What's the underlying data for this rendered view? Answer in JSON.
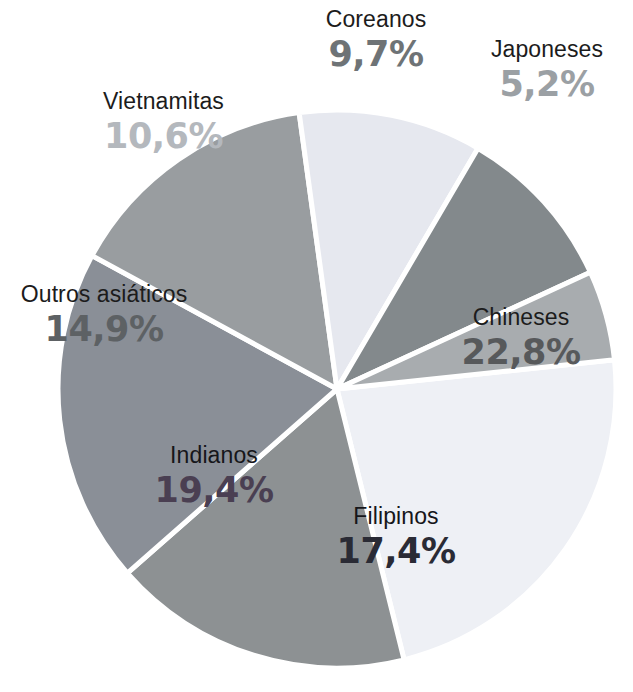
{
  "chart_data": {
    "type": "pie",
    "title": "",
    "subtitle": "",
    "xlabel": "",
    "ylabel": "",
    "legend_position": "none",
    "grid": false,
    "units": "%",
    "decimal_separator": ",",
    "total": 100.0,
    "categories": [
      "Chineses",
      "Filipinos",
      "Indianos",
      "Outros asiáticos",
      "Vietnamitas",
      "Coreanos",
      "Japoneses"
    ],
    "values": [
      22.8,
      17.4,
      19.4,
      14.9,
      10.6,
      9.7,
      5.2
    ],
    "slices": [
      {
        "label": "Chineses",
        "value": 22.8,
        "value_text": "22,8%",
        "color": "#eef0f5",
        "label_color": "#57595b",
        "name_color": "#1c1c1c"
      },
      {
        "label": "Filipinos",
        "value": 17.4,
        "value_text": "17,4%",
        "color": "#8d9193",
        "label_color": "#2a2b35",
        "name_color": "#16161a"
      },
      {
        "label": "Indianos",
        "value": 19.4,
        "value_text": "19,4%",
        "color": "#8a8f97",
        "label_color": "#4a3f52",
        "name_color": "#16161a"
      },
      {
        "label": "Outros asiáticos",
        "value": 14.9,
        "value_text": "14,9%",
        "color": "#999da0",
        "label_color": "#5d6164",
        "name_color": "#1c1c1c"
      },
      {
        "label": "Vietnamitas",
        "value": 10.6,
        "value_text": "10,6%",
        "color": "#e6e8ef",
        "label_color": "#b4b8bd",
        "name_color": "#1c1c1c"
      },
      {
        "label": "Coreanos",
        "value": 9.7,
        "value_text": "9,7%",
        "color": "#83898c",
        "label_color": "#6e7376",
        "name_color": "#1c1c1c"
      },
      {
        "label": "Japoneses",
        "value": 5.2,
        "value_text": "5,2%",
        "color": "#a8acaf",
        "label_color": "#9ba0a4",
        "name_color": "#1c1c1c"
      }
    ],
    "geometry": {
      "center_x": 337,
      "center_y": 389,
      "radius": 279,
      "start_angle_deg": -6,
      "separator_color": "#ffffff",
      "separator_width": 5,
      "background": "#ffffff"
    }
  }
}
